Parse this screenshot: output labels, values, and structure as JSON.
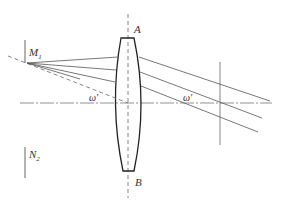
{
  "diagram": {
    "type": "optical-lens-ray-diagram",
    "labels": {
      "top_axis_point": "A",
      "bottom_axis_point": "B",
      "object_top": "M",
      "object_top_sub": "1",
      "object_bottom": "N",
      "object_bottom_sub": "2",
      "field_angle_left": "ω'",
      "field_angle_right": "ω'"
    },
    "elements": [
      "optical-axis",
      "lens-axis-AB",
      "biconvex-lens",
      "object-marker-M1",
      "object-marker-N2",
      "chief-ray-dashed",
      "incident-rays",
      "exit-parallel-rays",
      "image-plane-marker"
    ],
    "colors": {
      "line": "#555555",
      "lens": "#222222",
      "text": "#333333"
    }
  }
}
